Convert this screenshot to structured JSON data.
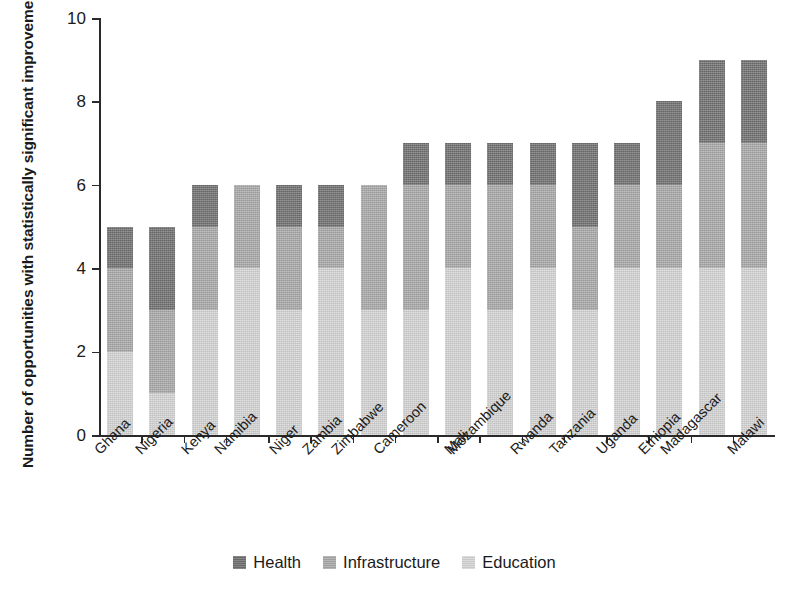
{
  "chart_data": {
    "type": "bar",
    "subtype": "stacked-bar-vertical",
    "title": "",
    "xlabel": "",
    "ylabel": "Number of opportunities with statistically significant improvements",
    "ylim": [
      0,
      10
    ],
    "ytick_values": [
      0,
      2,
      4,
      6,
      8,
      10
    ],
    "ytick_labels": [
      "0",
      "2",
      "4",
      "6",
      "8",
      "10"
    ],
    "grid": false,
    "legend_position": "bottom",
    "stack_order_bottom_to_top": [
      "Education",
      "Infrastructure",
      "Health"
    ],
    "categories": [
      "Ghana",
      "Nigeria",
      "Kenya",
      "Namibia",
      "Niger",
      "Zambia",
      "Zimbabwe",
      "Cameroon",
      "Mali",
      "Mozambique",
      "Rwanda",
      "Tanzania",
      "Uganda",
      "Ethiopia",
      "Madagascar",
      "Malawi"
    ],
    "series": [
      {
        "name": "Health",
        "color": "#6f6f6f",
        "values": [
          1,
          2,
          1,
          0,
          1,
          1,
          0,
          1,
          1,
          1,
          1,
          2,
          1,
          2,
          2,
          2
        ]
      },
      {
        "name": "Infrastructure",
        "color": "#a8a8a8",
        "values": [
          2,
          2,
          2,
          2,
          2,
          1,
          3,
          3,
          2,
          3,
          2,
          2,
          2,
          2,
          3,
          3
        ]
      },
      {
        "name": "Education",
        "color": "#d4d4d4",
        "values": [
          2,
          1,
          3,
          4,
          3,
          4,
          3,
          3,
          4,
          3,
          4,
          3,
          4,
          4,
          4,
          4
        ]
      }
    ],
    "totals": [
      5,
      5,
      6,
      6,
      6,
      6,
      6,
      7,
      7,
      7,
      7,
      7,
      7,
      8,
      9,
      9
    ]
  },
  "legend": {
    "items": [
      {
        "label": "Health",
        "color": "#6f6f6f",
        "key": "health"
      },
      {
        "label": "Infrastructure",
        "color": "#a8a8a8",
        "key": "infrastructure"
      },
      {
        "label": "Education",
        "color": "#d4d4d4",
        "key": "education"
      }
    ]
  }
}
